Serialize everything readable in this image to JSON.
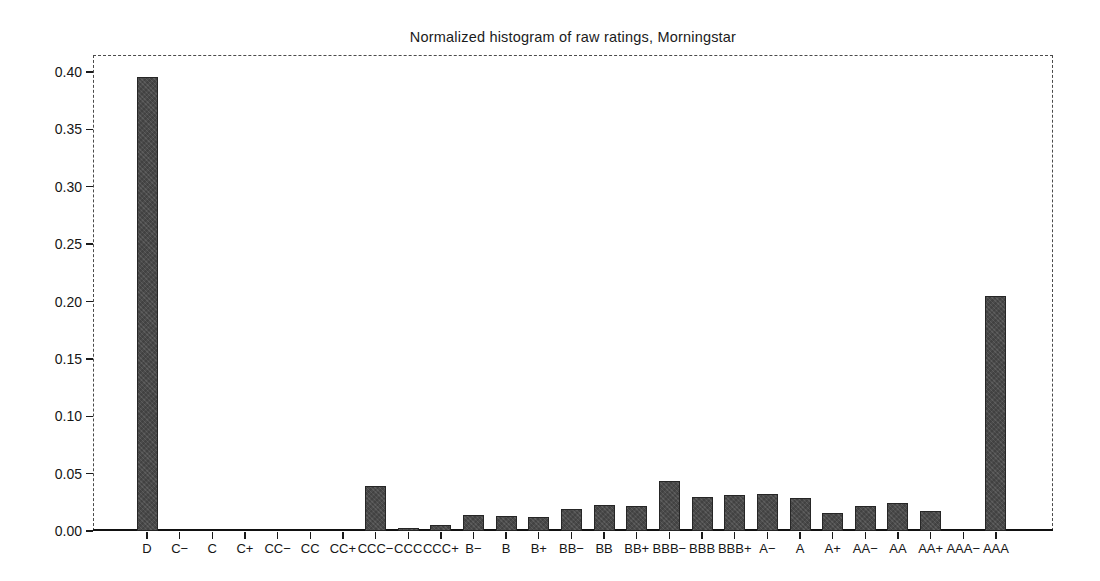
{
  "figure": {
    "background_color": "#ffffff",
    "bar_fill_color": "#4d4d4d",
    "bar_edge_color": "#262626",
    "axis_color": "#1a1a1a"
  },
  "chart_data": {
    "type": "bar",
    "title": "Normalized histogram of raw ratings, Morningstar",
    "xlabel": "",
    "ylabel": "",
    "categories": [
      "D",
      "C−",
      "C",
      "C+",
      "CC−",
      "CC",
      "CC+",
      "CCC−",
      "CCC",
      "CCC+",
      "B−",
      "B",
      "B+",
      "BB−",
      "BB",
      "BB+",
      "BBB−",
      "BBB",
      "BBB+",
      "A−",
      "A",
      "A+",
      "AA−",
      "AA",
      "AA+",
      "AAA−",
      "AAA"
    ],
    "values": [
      0.396,
      0,
      0,
      0,
      0,
      0,
      0,
      0.039,
      0.003,
      0.005,
      0.014,
      0.013,
      0.012,
      0.019,
      0.023,
      0.022,
      0.044,
      0.03,
      0.031,
      0.032,
      0.029,
      0.016,
      0.022,
      0.024,
      0.017,
      0,
      0.205
    ],
    "ylim": [
      0,
      0.414
    ],
    "yticks": [
      0.0,
      0.05,
      0.1,
      0.15,
      0.2,
      0.25,
      0.3,
      0.35,
      0.4
    ],
    "ytick_labels": [
      "0.00",
      "0.05",
      "0.10",
      "0.15",
      "0.20",
      "0.25",
      "0.30",
      "0.35",
      "0.40"
    ],
    "grid": false,
    "legend_position": "none"
  }
}
